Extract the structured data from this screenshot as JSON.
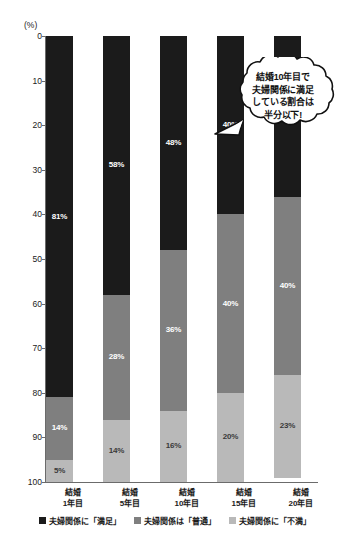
{
  "chart_data": {
    "type": "bar",
    "subtype": "stacked-bar-100",
    "title": "",
    "xlabel": "",
    "ylabel": "(%)",
    "ylim": [
      0,
      100
    ],
    "y_inverted": true,
    "grid": false,
    "legend_position": "bottom",
    "axis_unit_label": "(%)",
    "yticks": [
      0,
      10,
      20,
      30,
      40,
      50,
      60,
      70,
      80,
      90,
      100
    ],
    "ytick_labels": [
      "0",
      "10",
      "20",
      "30",
      "40",
      "50",
      "60",
      "70",
      "80",
      "90",
      "100"
    ],
    "categories": [
      "結婚\n1年目",
      "結婚\n5年目",
      "結婚\n10年目",
      "結婚\n15年目",
      "結婚\n20年目"
    ],
    "category_lines": [
      [
        "結婚",
        "1年目"
      ],
      [
        "結婚",
        "5年目"
      ],
      [
        "結婚",
        "10年目"
      ],
      [
        "結婚",
        "15年目"
      ],
      [
        "結婚",
        "20年目"
      ]
    ],
    "series": [
      {
        "name": "夫婦関係に「満足」",
        "color": "#1b1b1b",
        "values": [
          81,
          58,
          48,
          40,
          36
        ],
        "labels": [
          "81%",
          "58%",
          "48%",
          "40%",
          "36%"
        ]
      },
      {
        "name": "夫婦関係は「普通」",
        "color": "#7f7f7f",
        "values": [
          14,
          28,
          36,
          40,
          40
        ],
        "labels": [
          "14%",
          "28%",
          "36%",
          "40%",
          "40%"
        ]
      },
      {
        "name": "夫婦関係に「不満」",
        "color": "#b9b9b9",
        "values": [
          5,
          14,
          16,
          20,
          23
        ],
        "labels": [
          "5%",
          "14%",
          "16%",
          "20%",
          "23%"
        ]
      }
    ],
    "annotations": [
      {
        "type": "speech-bubble",
        "shape": "cloud",
        "target_category": "結婚20年目",
        "lines": [
          "結婚10年目で",
          "夫婦関係に満足",
          "している割合は",
          "半分以下!"
        ]
      }
    ]
  },
  "legend": {
    "items": [
      {
        "label": "夫婦関係に「満足」",
        "color": "#1b1b1b"
      },
      {
        "label": "夫婦関係は「普通」",
        "color": "#7f7f7f"
      },
      {
        "label": "夫婦関係に「不満」",
        "color": "#b9b9b9"
      }
    ]
  },
  "colors": {
    "satisfied": "#1b1b1b",
    "neutral": "#7f7f7f",
    "dissatisfied": "#b9b9b9",
    "axis": "#6b6b6b",
    "background": "#ffffff"
  }
}
